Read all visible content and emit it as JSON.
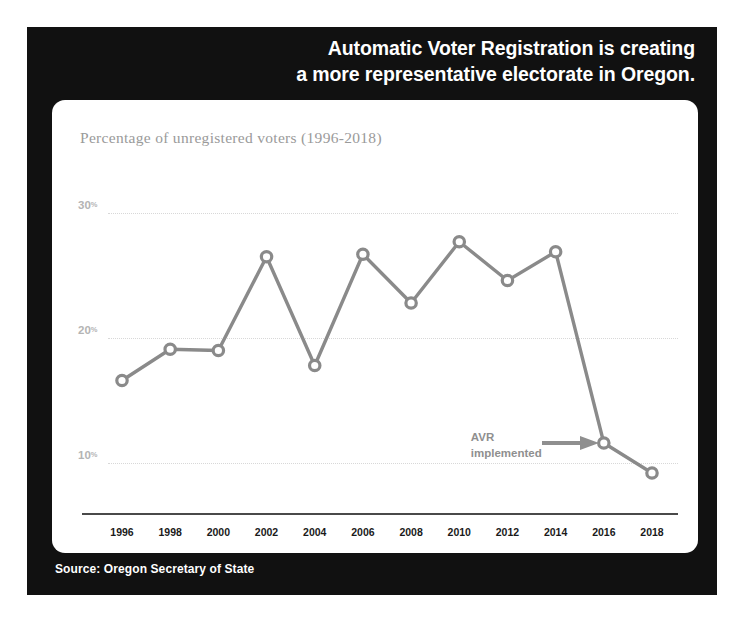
{
  "headline": {
    "line1": "Automatic Voter Registration is creating",
    "line2": "a more representative electorate in Oregon."
  },
  "footer": {
    "source": "Source: Oregon Secretary of State"
  },
  "annotation": {
    "line1": "AVR",
    "line2": "implemented",
    "arrow_icon": "arrow-right-icon"
  },
  "colors": {
    "panel_background": "#111111",
    "card_background": "#ffffff",
    "line": "#8a8a8a",
    "grid": "#d8d8d8",
    "axis": "#4a4a4a",
    "y_label": "#b4b4b4",
    "subtitle": "#9a9a9a",
    "headline": "#ffffff"
  },
  "chart_data": {
    "type": "line",
    "title": "Automatic Voter Registration is creating a more representative electorate in Oregon.",
    "subtitle": "Percentage of unregistered voters (1996-2018)",
    "xlabel": "",
    "ylabel": "",
    "grid": true,
    "legend": "none",
    "xlim": [
      1996,
      2018
    ],
    "ylim": [
      6,
      32
    ],
    "yticks": [
      10,
      20,
      30
    ],
    "ytick_labels": [
      "10%",
      "20%",
      "30%"
    ],
    "ytick_suffix": "%",
    "categories": [
      1996,
      1998,
      2000,
      2002,
      2004,
      2006,
      2008,
      2010,
      2012,
      2014,
      2016,
      2018
    ],
    "xtick_labels": [
      "1996",
      "1998",
      "2000",
      "2002",
      "2004",
      "2006",
      "2008",
      "2010",
      "2012",
      "2014",
      "2016",
      "2018"
    ],
    "values": [
      16.6,
      19.1,
      19.0,
      26.5,
      17.8,
      26.7,
      22.8,
      27.7,
      24.6,
      26.9,
      11.6,
      9.2
    ],
    "marker": "open-circle",
    "annotations": [
      {
        "text": "AVR implemented",
        "points_to_year": 2016
      }
    ]
  }
}
